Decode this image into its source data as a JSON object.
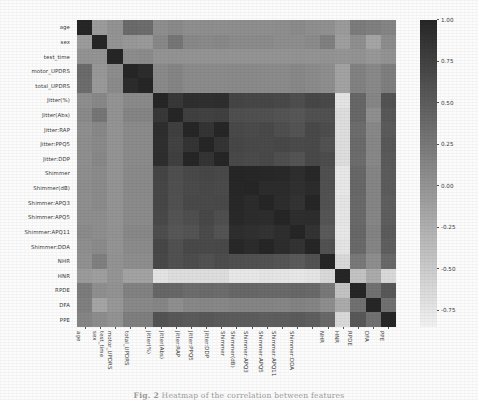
{
  "caption": {
    "prefix": "Fig. 2",
    "text": "Heatmap of the correlation between features"
  },
  "colorbar": {
    "ticks": [
      "1.00",
      "0.75",
      "0.50",
      "0.25",
      "0.00",
      "-0.25",
      "-0.50",
      "-0.75"
    ],
    "tick_values": [
      1.0,
      0.75,
      0.5,
      0.25,
      0.0,
      -0.25,
      -0.5,
      -0.75
    ],
    "vmin": -0.85,
    "vmax": 1.0,
    "colormap": "grayscale-reversed",
    "high_color": "#2b2b2b",
    "low_color": "#f2f2f2"
  },
  "chart_data": {
    "type": "heatmap",
    "title": "Heatmap of the correlation between features",
    "xlabel": "",
    "ylabel": "",
    "grid": false,
    "legend_position": "right",
    "colorbar_range": [
      -0.85,
      1.0
    ],
    "categories": [
      "age",
      "sex",
      "test_time",
      "motor_UPDRS",
      "total_UPDRS",
      "Jitter(%)",
      "Jitter(Abs)",
      "Jitter:RAP",
      "Jitter:PPQ5",
      "Jitter:DDP",
      "Shimmer",
      "Shimmer(dB)",
      "Shimmer:APQ3",
      "Shimmer:APQ5",
      "Shimmer:APQ11",
      "Shimmer:DDA",
      "NHR",
      "HNR",
      "RPDE",
      "DFA",
      "PPE"
    ],
    "xticklabels": [
      "age",
      "sex",
      "test_time",
      "motor_UPDRS",
      "total_UPDRS",
      "Jitter(%)",
      "Jitter(Abs)",
      "Jitter:RAP",
      "Jitter:PPQ5",
      "Jitter:DDP",
      "Shimmer",
      "Shimmer(dB)",
      "Shimmer:APQ3",
      "Shimmer:APQ5",
      "Shimmer:APQ11",
      "Shimmer:DDA",
      "NHR",
      "HNR",
      "RPDE",
      "DFA",
      "PPE"
    ],
    "yticklabels": [
      "age",
      "sex",
      "test_time",
      "motor_UPDRS",
      "total_UPDRS",
      "Jitter(%)",
      "Jitter(Abs)",
      "Jitter:RAP",
      "Jitter:PPQ5",
      "Jitter:DDP",
      "Shimmer",
      "Shimmer(dB)",
      "Shimmer:APQ3",
      "Shimmer:APQ5",
      "Shimmer:APQ11",
      "Shimmer:DDA",
      "NHR",
      "HNR",
      "RPDE",
      "DFA",
      "PPE"
    ],
    "matrix": [
      [
        1.0,
        -0.07,
        0.01,
        0.37,
        0.36,
        0.06,
        0.09,
        0.05,
        0.06,
        0.05,
        0.06,
        0.06,
        0.05,
        0.06,
        0.08,
        0.05,
        0.03,
        -0.06,
        0.22,
        0.18,
        0.14
      ],
      [
        -0.07,
        1.0,
        0.0,
        -0.03,
        -0.05,
        0.11,
        0.27,
        0.11,
        0.09,
        0.11,
        0.08,
        0.08,
        0.08,
        0.06,
        0.06,
        0.08,
        0.18,
        -0.1,
        0.05,
        -0.15,
        0.07
      ],
      [
        0.01,
        0.0,
        1.0,
        0.07,
        0.08,
        0.0,
        0.01,
        0.0,
        0.0,
        0.0,
        0.0,
        0.0,
        0.0,
        0.0,
        0.01,
        0.0,
        0.01,
        -0.01,
        0.01,
        -0.03,
        0.01
      ],
      [
        0.37,
        -0.03,
        0.07,
        1.0,
        0.95,
        0.09,
        0.14,
        0.08,
        0.08,
        0.08,
        0.09,
        0.09,
        0.08,
        0.08,
        0.11,
        0.08,
        0.06,
        -0.13,
        0.17,
        0.1,
        0.19
      ],
      [
        0.36,
        -0.05,
        0.08,
        0.95,
        1.0,
        0.09,
        0.14,
        0.08,
        0.08,
        0.08,
        0.09,
        0.09,
        0.08,
        0.08,
        0.11,
        0.08,
        0.06,
        -0.13,
        0.17,
        0.1,
        0.19
      ],
      [
        0.06,
        0.11,
        0.0,
        0.09,
        0.09,
        1.0,
        0.84,
        0.93,
        0.92,
        0.93,
        0.72,
        0.7,
        0.7,
        0.68,
        0.64,
        0.7,
        0.68,
        -0.72,
        0.41,
        0.13,
        0.59
      ],
      [
        0.09,
        0.27,
        0.01,
        0.14,
        0.14,
        0.84,
        1.0,
        0.76,
        0.75,
        0.76,
        0.63,
        0.62,
        0.61,
        0.58,
        0.56,
        0.61,
        0.61,
        -0.67,
        0.4,
        0.05,
        0.55
      ],
      [
        0.05,
        0.11,
        0.0,
        0.08,
        0.08,
        0.93,
        0.76,
        1.0,
        0.87,
        1.0,
        0.68,
        0.66,
        0.68,
        0.63,
        0.58,
        0.68,
        0.65,
        -0.67,
        0.36,
        0.11,
        0.52
      ],
      [
        0.06,
        0.09,
        0.0,
        0.08,
        0.08,
        0.92,
        0.75,
        0.87,
        1.0,
        0.87,
        0.7,
        0.68,
        0.67,
        0.69,
        0.66,
        0.67,
        0.6,
        -0.67,
        0.37,
        0.12,
        0.55
      ],
      [
        0.05,
        0.11,
        0.0,
        0.08,
        0.08,
        0.93,
        0.76,
        1.0,
        0.87,
        1.0,
        0.68,
        0.66,
        0.68,
        0.63,
        0.58,
        0.68,
        0.65,
        -0.67,
        0.36,
        0.11,
        0.52
      ],
      [
        0.06,
        0.08,
        0.0,
        0.09,
        0.09,
        0.72,
        0.63,
        0.68,
        0.7,
        0.68,
        1.0,
        0.99,
        0.98,
        0.97,
        0.93,
        0.98,
        0.62,
        -0.76,
        0.4,
        0.14,
        0.51
      ],
      [
        0.06,
        0.08,
        0.0,
        0.09,
        0.09,
        0.7,
        0.62,
        0.66,
        0.68,
        0.66,
        0.99,
        1.0,
        0.95,
        0.95,
        0.91,
        0.95,
        0.61,
        -0.76,
        0.4,
        0.14,
        0.51
      ],
      [
        0.05,
        0.08,
        0.0,
        0.08,
        0.08,
        0.7,
        0.61,
        0.68,
        0.67,
        0.68,
        0.98,
        0.95,
        1.0,
        0.94,
        0.88,
        1.0,
        0.6,
        -0.73,
        0.38,
        0.14,
        0.48
      ],
      [
        0.06,
        0.06,
        0.0,
        0.08,
        0.08,
        0.68,
        0.58,
        0.63,
        0.69,
        0.63,
        0.97,
        0.95,
        0.94,
        1.0,
        0.93,
        0.94,
        0.57,
        -0.74,
        0.38,
        0.13,
        0.49
      ],
      [
        0.08,
        0.06,
        0.01,
        0.11,
        0.11,
        0.64,
        0.56,
        0.58,
        0.66,
        0.58,
        0.93,
        0.91,
        0.88,
        0.93,
        1.0,
        0.88,
        0.53,
        -0.76,
        0.4,
        0.16,
        0.52
      ],
      [
        0.05,
        0.08,
        0.0,
        0.08,
        0.08,
        0.7,
        0.61,
        0.68,
        0.67,
        0.68,
        0.98,
        0.95,
        1.0,
        0.94,
        0.88,
        1.0,
        0.6,
        -0.73,
        0.38,
        0.14,
        0.48
      ],
      [
        0.03,
        0.18,
        0.01,
        0.06,
        0.06,
        0.68,
        0.61,
        0.65,
        0.6,
        0.65,
        0.62,
        0.61,
        0.6,
        0.57,
        0.53,
        0.6,
        1.0,
        -0.62,
        0.25,
        0.06,
        0.39
      ],
      [
        -0.06,
        -0.1,
        -0.01,
        -0.13,
        -0.13,
        -0.72,
        -0.67,
        -0.67,
        -0.67,
        -0.67,
        -0.76,
        -0.76,
        -0.73,
        -0.74,
        -0.76,
        -0.73,
        -0.62,
        1.0,
        -0.42,
        -0.21,
        -0.62
      ],
      [
        0.22,
        0.05,
        0.01,
        0.17,
        0.17,
        0.41,
        0.4,
        0.36,
        0.37,
        0.36,
        0.4,
        0.4,
        0.38,
        0.38,
        0.4,
        0.38,
        0.25,
        -0.42,
        1.0,
        0.32,
        0.55
      ],
      [
        0.18,
        -0.15,
        -0.03,
        0.1,
        0.1,
        0.13,
        0.05,
        0.11,
        0.12,
        0.11,
        0.14,
        0.14,
        0.14,
        0.13,
        0.16,
        0.14,
        0.06,
        -0.21,
        0.32,
        1.0,
        0.32
      ],
      [
        0.14,
        0.07,
        0.01,
        0.19,
        0.19,
        0.59,
        0.55,
        0.52,
        0.55,
        0.52,
        0.51,
        0.51,
        0.48,
        0.49,
        0.52,
        0.48,
        0.39,
        -0.62,
        0.55,
        0.32,
        1.0
      ]
    ]
  }
}
